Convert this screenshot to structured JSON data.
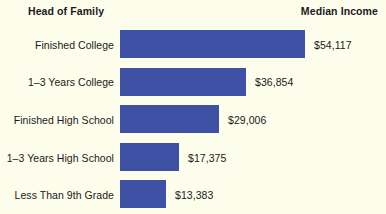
{
  "header": {
    "left_title": "Head of Family",
    "right_title": "Median Income"
  },
  "colors": {
    "bar": "#3f51a5",
    "background": "#fdfdec",
    "text": "#1a1a1a"
  },
  "chart_data": {
    "type": "bar",
    "orientation": "horizontal",
    "title": "",
    "xlabel": "Median Income",
    "ylabel": "Head of Family",
    "grid": false,
    "legend": false,
    "axis_visible": false,
    "xlim": [
      0,
      60000
    ],
    "categories": [
      "Finished College",
      "1–3 Years College",
      "Finished High School",
      "1–3 Years High School",
      "Less Than 9th Grade"
    ],
    "values": [
      54117,
      36854,
      29006,
      17375,
      13383
    ],
    "value_labels": [
      "$54,117",
      "$36,854",
      "$29,006",
      "$17,375",
      "$13,383"
    ],
    "series": [
      {
        "name": "Median Income",
        "values": [
          54117,
          36854,
          29006,
          17375,
          13383
        ],
        "color": "#3f51a5"
      }
    ]
  }
}
